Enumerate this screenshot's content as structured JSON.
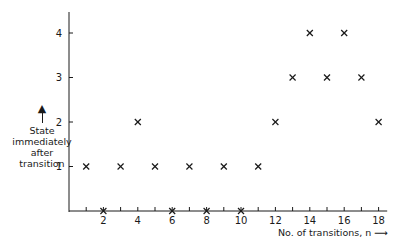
{
  "chart_data": {
    "type": "scatter",
    "title": "",
    "xlabel": "No. of transitions, n",
    "ylabel": "State immediately after transition",
    "x": [
      1,
      2,
      3,
      4,
      5,
      6,
      7,
      8,
      9,
      10,
      11,
      12,
      13,
      14,
      15,
      16,
      17,
      18
    ],
    "values": [
      1,
      0,
      1,
      2,
      1,
      0,
      1,
      0,
      1,
      0,
      1,
      2,
      3,
      4,
      3,
      4,
      3,
      2
    ],
    "marker": "x",
    "xticks": [
      1,
      2,
      3,
      4,
      5,
      6,
      7,
      8,
      9,
      10,
      11,
      12,
      13,
      14,
      15,
      16,
      17,
      18
    ],
    "xtick_labels": [
      "2",
      "4",
      "6",
      "8",
      "10",
      "12",
      "14",
      "16",
      "18"
    ],
    "yticks": [
      1,
      2,
      3,
      4
    ],
    "ytick_labels": [
      "1",
      "2",
      "3",
      "4"
    ],
    "xlim": [
      0,
      18.5
    ],
    "ylim": [
      0,
      4.5
    ],
    "grid": false,
    "legend": null
  },
  "labels": {
    "ylabel_lines": [
      "State",
      "immediately",
      "after",
      "transition"
    ],
    "xlabel": "No. of transitions, n"
  },
  "colors": {
    "ink": "#1a1a1a",
    "background": "#ffffff"
  }
}
